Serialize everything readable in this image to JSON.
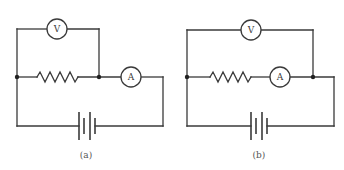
{
  "figure": {
    "panels": [
      {
        "id": "a",
        "caption": "(a)",
        "description": "Voltmeter across resistor only; ammeter in series after the voltmeter junction",
        "voltmeter": {
          "label": "V"
        },
        "ammeter": {
          "label": "A"
        },
        "resistor": {
          "symbol": "zigzag"
        },
        "battery": {
          "cells": 2
        }
      },
      {
        "id": "b",
        "caption": "(b)",
        "description": "Voltmeter across resistor and ammeter together; ammeter in series with resistor",
        "voltmeter": {
          "label": "V"
        },
        "ammeter": {
          "label": "A"
        },
        "resistor": {
          "symbol": "zigzag"
        },
        "battery": {
          "cells": 2
        }
      }
    ],
    "colors": {
      "line": "#3a3a3a",
      "background": "#ffffff",
      "caption": "#555555"
    }
  }
}
